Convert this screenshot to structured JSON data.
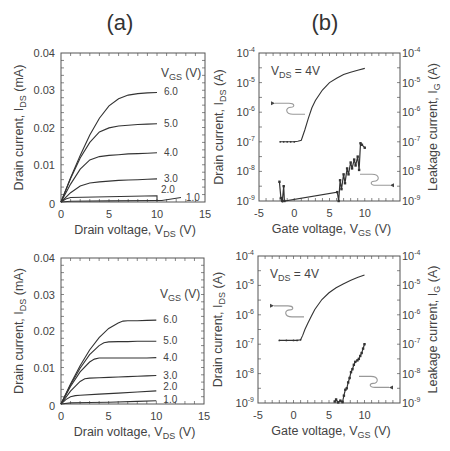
{
  "panel_labels": [
    "(a)",
    "(b)"
  ],
  "chart_data": [
    {
      "id": "a-top",
      "type": "line",
      "title": "(a)",
      "xlabel": "Drain voltage, V_DS (V)",
      "ylabel": "Drain current, I_DS (mA)",
      "xlim": [
        0,
        15
      ],
      "ylim": [
        0,
        0.04
      ],
      "xticks": [
        0,
        5,
        10,
        15
      ],
      "yticks": [
        0,
        0.01,
        0.02,
        0.03,
        0.04
      ],
      "ytick_labels": [
        "0",
        "0.01",
        "0.02",
        "0.03",
        "0.04"
      ],
      "legend_title": "V_GS (V)",
      "series": [
        {
          "name": "6.0",
          "x": [
            0,
            1,
            2,
            3,
            4,
            5,
            6,
            7,
            8,
            9,
            10
          ],
          "y": [
            0,
            0.0065,
            0.0125,
            0.018,
            0.0225,
            0.0258,
            0.0277,
            0.0287,
            0.0291,
            0.0293,
            0.0294
          ]
        },
        {
          "name": "5.0",
          "x": [
            0,
            1,
            2,
            3,
            4,
            5,
            6,
            7,
            8,
            9,
            10
          ],
          "y": [
            0,
            0.0063,
            0.0118,
            0.016,
            0.0188,
            0.0199,
            0.0204,
            0.0206,
            0.0208,
            0.0209,
            0.021
          ]
        },
        {
          "name": "4.0",
          "x": [
            0,
            1,
            2,
            3,
            4,
            5,
            6,
            7,
            8,
            9,
            10
          ],
          "y": [
            0,
            0.0048,
            0.0088,
            0.0113,
            0.0122,
            0.0125,
            0.0127,
            0.0129,
            0.013,
            0.0131,
            0.0132
          ]
        },
        {
          "name": "3.0",
          "x": [
            0,
            1,
            2,
            3,
            4,
            5,
            6,
            7,
            8,
            9,
            10
          ],
          "y": [
            0,
            0.0025,
            0.0043,
            0.0051,
            0.0054,
            0.0056,
            0.0058,
            0.0059,
            0.006,
            0.0061,
            0.0062
          ]
        },
        {
          "name": "2.0",
          "x": [
            0,
            0.5,
            1,
            10,
            10
          ],
          "y": [
            0,
            0.0008,
            0.0012,
            0.0017,
            0.0002
          ]
        },
        {
          "name": "1.0",
          "x": [
            0,
            1,
            5,
            10,
            10.5,
            12.5
          ],
          "y": [
            0,
            0.0002,
            0.0003,
            0.0004,
            0.0004,
            0.0012
          ]
        }
      ]
    },
    {
      "id": "b-top",
      "type": "line",
      "title": "(b)",
      "annotation": "V_DS = 4V",
      "xlabel": "Gate voltage, V_GS (V)",
      "ylabel_left": "Drain current, I_DS (A)",
      "ylabel_right": "Leakage current, I_G (A)",
      "xlim": [
        -5,
        15
      ],
      "ylim_log": [
        -9,
        -4
      ],
      "xticks": [
        -5,
        0,
        5,
        10
      ],
      "yticks_exp": [
        -9,
        -8,
        -7,
        -6,
        -5,
        -4
      ],
      "series": [
        {
          "name": "I_DS",
          "axis": "left",
          "x": [
            -2,
            -1.5,
            -1,
            -0.5,
            0,
            0.5,
            1,
            1.5,
            2,
            2.5,
            3,
            4,
            5,
            6,
            7,
            8,
            9,
            10
          ],
          "y_exp": [
            -7,
            -7,
            -7,
            -7,
            -7,
            -6.98,
            -6.95,
            -6.6,
            -6.2,
            -5.85,
            -5.6,
            -5.25,
            -5.0,
            -4.85,
            -4.73,
            -4.65,
            -4.58,
            -4.52
          ]
        },
        {
          "name": "I_G",
          "axis": "right",
          "x": [
            -2.1,
            -1.9,
            -1.7,
            -1.5,
            -1.4,
            6.1,
            6.3,
            6.5,
            6.7,
            7.0,
            7.2,
            7.5,
            7.7,
            8.0,
            8.2,
            8.5,
            8.7,
            9.0,
            9.2,
            9.4,
            9.6,
            10.0
          ],
          "y_exp": [
            -8.35,
            -8.9,
            -9.0,
            -8.5,
            -9.0,
            -8.7,
            -9.0,
            -8.3,
            -8.6,
            -8.1,
            -8.4,
            -7.9,
            -8.1,
            -7.7,
            -7.9,
            -7.6,
            -7.8,
            -7.5,
            -7.95,
            -7.05,
            -7.1,
            -7.2
          ]
        }
      ],
      "arrows": [
        {
          "direction": "left",
          "target_axis": "left"
        },
        {
          "direction": "right",
          "target_axis": "right"
        }
      ]
    },
    {
      "id": "a-bottom",
      "type": "line",
      "xlabel": "Drain voltage, V_DS (V)",
      "ylabel": "Drain current, I_DS (mA)",
      "xlim": [
        0,
        15
      ],
      "ylim": [
        0,
        0.04
      ],
      "xticks": [
        0,
        5,
        10,
        15
      ],
      "yticks": [
        0,
        0.01,
        0.02,
        0.03,
        0.04
      ],
      "ytick_labels": [
        "0",
        "0.01",
        "0.02",
        "0.03",
        "0.04"
      ],
      "legend_title": "V_GS (V)",
      "series": [
        {
          "name": "6.0",
          "x": [
            0,
            1,
            2,
            3,
            4,
            5,
            6,
            6.5,
            7,
            8,
            9,
            10
          ],
          "y": [
            0,
            0.0055,
            0.0105,
            0.0148,
            0.0182,
            0.0207,
            0.0222,
            0.0227,
            0.0228,
            0.0228,
            0.0229,
            0.023
          ]
        },
        {
          "name": "5.0",
          "x": [
            0,
            1,
            2,
            3,
            4,
            4.5,
            5,
            6,
            7,
            8,
            9,
            10
          ],
          "y": [
            0,
            0.0052,
            0.0098,
            0.0135,
            0.016,
            0.0168,
            0.017,
            0.0171,
            0.0171,
            0.0172,
            0.0172,
            0.0172
          ]
        },
        {
          "name": "4.0",
          "x": [
            0,
            1,
            2,
            3,
            3.5,
            4,
            5,
            6,
            7,
            8,
            9,
            10
          ],
          "y": [
            0,
            0.0048,
            0.0088,
            0.0115,
            0.0123,
            0.0126,
            0.0126,
            0.0126,
            0.0126,
            0.0126,
            0.0126,
            0.0127
          ]
        },
        {
          "name": "3.0",
          "x": [
            0,
            1,
            2,
            2.5,
            3,
            4,
            5,
            6,
            7,
            8,
            9,
            10
          ],
          "y": [
            0,
            0.0035,
            0.0062,
            0.0069,
            0.0071,
            0.0072,
            0.0073,
            0.0074,
            0.0075,
            0.0076,
            0.0077,
            0.0078
          ]
        },
        {
          "name": "2.0",
          "x": [
            0,
            0.5,
            1,
            1.5,
            2,
            4,
            6,
            8,
            10
          ],
          "y": [
            0,
            0.0012,
            0.002,
            0.0023,
            0.0024,
            0.0027,
            0.003,
            0.0033,
            0.0036
          ]
        },
        {
          "name": "1.0",
          "x": [
            0,
            1,
            3,
            5,
            8,
            10
          ],
          "y": [
            0,
            0.0003,
            0.0004,
            0.0005,
            0.0007,
            0.0009
          ]
        }
      ]
    },
    {
      "id": "b-bottom",
      "type": "line",
      "annotation": "V_DS = 4V",
      "xlabel": "Gate voltage, V_GS (V)",
      "ylabel_left": "Drain current, I_DS (A)",
      "ylabel_right": "Leakage current, I_G (A)",
      "xlim": [
        -5,
        15
      ],
      "ylim_log": [
        -9,
        -4
      ],
      "xticks": [
        -5,
        0,
        5,
        10
      ],
      "yticks_exp": [
        -9,
        -8,
        -7,
        -6,
        -5,
        -4
      ],
      "series": [
        {
          "name": "I_DS",
          "axis": "left",
          "x": [
            -2,
            -1,
            0,
            0.5,
            1,
            1.3,
            1.6,
            2,
            2.5,
            3,
            4,
            5,
            6,
            7,
            8,
            9,
            10
          ],
          "y_exp": [
            -6.87,
            -6.87,
            -6.87,
            -6.87,
            -6.85,
            -6.7,
            -6.5,
            -6.3,
            -6.05,
            -5.82,
            -5.48,
            -5.25,
            -5.08,
            -4.95,
            -4.83,
            -4.73,
            -4.65
          ]
        },
        {
          "name": "I_G",
          "axis": "right",
          "x": [
            5.8,
            6.0,
            6.3,
            6.6,
            6.9,
            7.1,
            7.3,
            7.5,
            7.7,
            7.9,
            8.1,
            8.3,
            8.5,
            8.7,
            9.0,
            9.2,
            9.4,
            9.6,
            9.8,
            10.0
          ],
          "y_exp": [
            -8.95,
            -8.88,
            -8.98,
            -8.92,
            -8.97,
            -8.75,
            -8.55,
            -8.5,
            -8.3,
            -8.15,
            -7.95,
            -7.85,
            -7.7,
            -7.6,
            -7.55,
            -7.5,
            -7.4,
            -7.3,
            -7.15,
            -7.0
          ]
        }
      ],
      "arrows": [
        {
          "direction": "left",
          "target_axis": "left"
        },
        {
          "direction": "right",
          "target_axis": "right"
        }
      ]
    }
  ],
  "labels": {
    "drain_current": "Drain current, I",
    "drain_current_sub": "DS",
    "drain_current_unit_a": " (mA)",
    "drain_current_unit_b": " (A)",
    "drain_voltage": "Drain voltage, V",
    "drain_voltage_sub": "DS",
    "gate_voltage": "Gate voltage, V",
    "gate_voltage_sub": "GS",
    "unit_v": " (V)",
    "leakage_current": "Leakage current, I",
    "leakage_current_sub": "G",
    "vgs_legend_v": "V",
    "vgs_legend_sub": "GS",
    "vgs_legend_unit": " (V)",
    "vds_ann_v": "V",
    "vds_ann_sub": "DS",
    "vds_ann_val": " = 4V",
    "log_base": "10"
  }
}
